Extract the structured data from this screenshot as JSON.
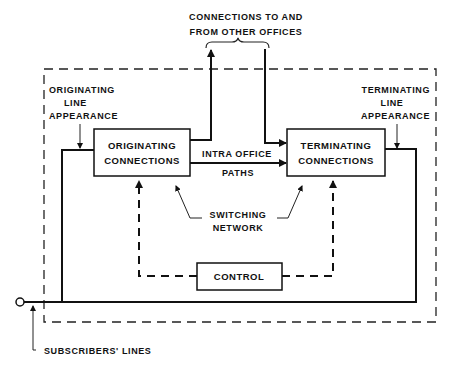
{
  "diagram": {
    "top_label": {
      "line1": "CONNECTIONS TO AND",
      "line2": "FROM OTHER  OFFICES"
    },
    "originating_line_appearance": {
      "line1": "ORIGINATING",
      "line2": "LINE",
      "line3": "APPEARANCE"
    },
    "terminating_line_appearance": {
      "line1": "TERMINATING",
      "line2": "LINE",
      "line3": "APPEARANCE"
    },
    "originating_box": {
      "line1": "ORIGINATING",
      "line2": "CONNECTIONS"
    },
    "terminating_box": {
      "line1": "TERMINATING",
      "line2": "CONNECTIONS"
    },
    "intraoffice_paths": {
      "line1": "INTRA OFFICE",
      "line2": "PATHS"
    },
    "switching_network": {
      "line1": "SWITCHING",
      "line2": "NETWORK"
    },
    "control_box": {
      "label": "CONTROL"
    },
    "subscribers_lines": {
      "label": "SUBSCRIBERS' LINES"
    }
  }
}
